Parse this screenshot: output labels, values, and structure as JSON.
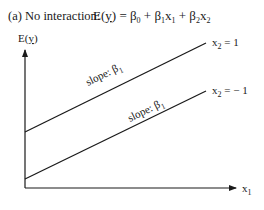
{
  "figure": {
    "panel_label": "(a) No interaction:",
    "equation": {
      "lhs": "E(",
      "lhs_var": "y",
      "lhs_close": ")",
      "rhs_parts": [
        {
          "text": " = β",
          "sub": "0"
        },
        {
          "text": " + β",
          "sub": "1"
        },
        {
          "text": "x",
          "sub": "1"
        },
        {
          "text": " + β",
          "sub": "2"
        },
        {
          "text": "x",
          "sub": "2"
        }
      ]
    },
    "y_axis": {
      "label": "E(",
      "label_var": "y",
      "label_close": ")"
    },
    "x_axis": {
      "label": "x",
      "label_sub": "1"
    },
    "lines": [
      {
        "id": "x2-pos",
        "label": "x",
        "label_sub": "2",
        "label_value": " = 1",
        "slope_label": "slope: β",
        "slope_sub": "1"
      },
      {
        "id": "x2-neg",
        "label": "x",
        "label_sub": "2",
        "label_value": " = − 1",
        "slope_label": "slope: β",
        "slope_sub": "1"
      }
    ],
    "colors": {
      "ink": "#1a1a1a",
      "background": "#ffffff"
    }
  }
}
